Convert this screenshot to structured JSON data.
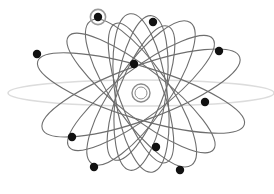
{
  "figure": {
    "kind": "atomic-orbital-diagram",
    "width": 274,
    "height": 194,
    "background_color": "#ffffff"
  },
  "nucleus": {
    "name": "nucleus",
    "cx": 141,
    "cy": 93,
    "radius": 9,
    "inner_radius": 6,
    "color": "#8c8c8c",
    "fill": "#ffffff"
  },
  "style": {
    "orbit_color": "#6e6e6e",
    "orbit_width": 1.1,
    "faint_orbit_color": "#dcdcdc",
    "faint_orbit_width": 1.6,
    "electron_color": "#111111",
    "electron_radius": 4.2,
    "halo_color": "#9a9a9a",
    "halo_radius": 7.6,
    "halo_width": 1.6
  },
  "orbits": [
    {
      "name": "orbit-horizontal-faint",
      "rx": 133,
      "ry": 13,
      "rotation": 0,
      "faint": true
    },
    {
      "name": "orbit-1",
      "rx": 108,
      "ry": 26,
      "rotation": 17,
      "faint": false
    },
    {
      "name": "orbit-2",
      "rx": 105,
      "ry": 27,
      "rotation": 160,
      "faint": false
    },
    {
      "name": "orbit-3",
      "rx": 88,
      "ry": 28,
      "rotation": 55,
      "faint": false
    },
    {
      "name": "orbit-4",
      "rx": 86,
      "ry": 27,
      "rotation": 125,
      "faint": false
    },
    {
      "name": "orbit-5",
      "rx": 80,
      "ry": 26,
      "rotation": 82,
      "faint": false
    },
    {
      "name": "orbit-6",
      "rx": 78,
      "ry": 25,
      "rotation": 98,
      "faint": false
    },
    {
      "name": "orbit-7",
      "rx": 92,
      "ry": 24,
      "rotation": 38,
      "faint": false
    },
    {
      "name": "orbit-8",
      "rx": 90,
      "ry": 24,
      "rotation": 143,
      "faint": false
    },
    {
      "name": "orbit-9",
      "rx": 74,
      "ry": 22,
      "rotation": 70,
      "faint": false
    },
    {
      "name": "orbit-10",
      "rx": 72,
      "ry": 22,
      "rotation": 112,
      "faint": false
    }
  ],
  "electrons": [
    {
      "name": "electron-highlighted-top-left",
      "cx": 98,
      "cy": 17,
      "highlighted": true
    },
    {
      "name": "electron-top-center",
      "cx": 153,
      "cy": 22,
      "highlighted": false
    },
    {
      "name": "electron-left-upper",
      "cx": 37,
      "cy": 54,
      "highlighted": false
    },
    {
      "name": "electron-right-upper",
      "cx": 219,
      "cy": 51,
      "highlighted": false
    },
    {
      "name": "electron-center-upper",
      "cx": 134,
      "cy": 64,
      "highlighted": false
    },
    {
      "name": "electron-right-lower",
      "cx": 205,
      "cy": 102,
      "highlighted": false
    },
    {
      "name": "electron-left-lower",
      "cx": 72,
      "cy": 137,
      "highlighted": false
    },
    {
      "name": "electron-center-lower",
      "cx": 156,
      "cy": 147,
      "highlighted": false
    },
    {
      "name": "electron-bottom-left",
      "cx": 94,
      "cy": 167,
      "highlighted": false
    },
    {
      "name": "electron-bottom-right",
      "cx": 180,
      "cy": 170,
      "highlighted": false
    }
  ]
}
